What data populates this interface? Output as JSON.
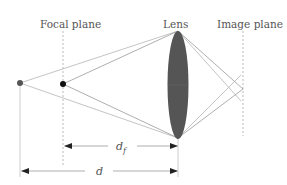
{
  "labels": {
    "focal_plane": "Focal plane",
    "lens": "Lens",
    "image_plane": "Image plane",
    "d_f": "d",
    "d_f_sub": "f",
    "d": "d"
  },
  "colors": {
    "ray": "#b0b0b0",
    "ray_dark": "#8a8a8a",
    "lens_fill": "#555555",
    "point_far": "#555555",
    "point_focal": "#111111",
    "dashed": "#aaaaaa",
    "arrow": "#222222",
    "dim_line": "#cccccc"
  }
}
